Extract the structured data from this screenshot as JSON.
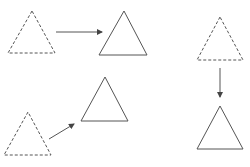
{
  "diagram": {
    "colors": {
      "stroke": "#555555",
      "background": "#ffffff"
    },
    "shapes": [
      {
        "id": "source-top-left",
        "kind": "triangle",
        "style": "dashed",
        "points": [
          [
            32,
            11
          ],
          [
            8,
            53
          ],
          [
            55,
            53
          ]
        ]
      },
      {
        "id": "target-top-middle",
        "kind": "triangle",
        "style": "solid",
        "points": [
          [
            124,
            11
          ],
          [
            99,
            55
          ],
          [
            147,
            55
          ]
        ]
      },
      {
        "id": "source-bottom-left",
        "kind": "triangle",
        "style": "dashed",
        "points": [
          [
            28,
            112
          ],
          [
            4,
            155
          ],
          [
            51,
            155
          ]
        ]
      },
      {
        "id": "target-bottom-middle",
        "kind": "triangle",
        "style": "solid",
        "points": [
          [
            105,
            77
          ],
          [
            81,
            121
          ],
          [
            128,
            121
          ]
        ]
      },
      {
        "id": "source-right-top",
        "kind": "triangle",
        "style": "dashed",
        "points": [
          [
            220,
            17
          ],
          [
            197,
            60
          ],
          [
            243,
            60
          ]
        ]
      },
      {
        "id": "target-right-bottom",
        "kind": "triangle",
        "style": "solid",
        "points": [
          [
            220,
            106
          ],
          [
            197,
            149
          ],
          [
            243,
            149
          ]
        ]
      }
    ],
    "arrows": [
      {
        "id": "arrow-right",
        "from": [
          56,
          32
        ],
        "to": [
          102,
          32
        ]
      },
      {
        "id": "arrow-diagonal",
        "from": [
          49,
          139
        ],
        "to": [
          74,
          124
        ]
      },
      {
        "id": "arrow-down",
        "from": [
          220,
          68
        ],
        "to": [
          220,
          97
        ]
      }
    ]
  }
}
